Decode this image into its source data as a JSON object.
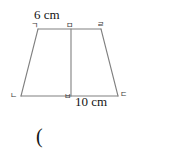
{
  "figure": {
    "type": "trapezoid-with-height-segment",
    "stroke_color": "#808080",
    "stroke_width": 1,
    "background_color": "#ffffff",
    "vertices": {
      "top_left": {
        "label": "ㄱ",
        "x": 38,
        "y": 29
      },
      "top_right": {
        "label": "ㄹ",
        "x": 101,
        "y": 29
      },
      "bottom_right": {
        "label": "ㄷ",
        "x": 118,
        "y": 96
      },
      "bottom_left": {
        "label": "ㄴ",
        "x": 21,
        "y": 96
      },
      "top_mid": {
        "label": "ㅁ",
        "x": 71,
        "y": 29
      },
      "bottom_mid": {
        "label": "ㅂ",
        "x": 71,
        "y": 96
      }
    },
    "measurements": {
      "top_side": "6 cm",
      "bottom_side": "10 cm"
    }
  },
  "annotation": {
    "paren": "("
  }
}
